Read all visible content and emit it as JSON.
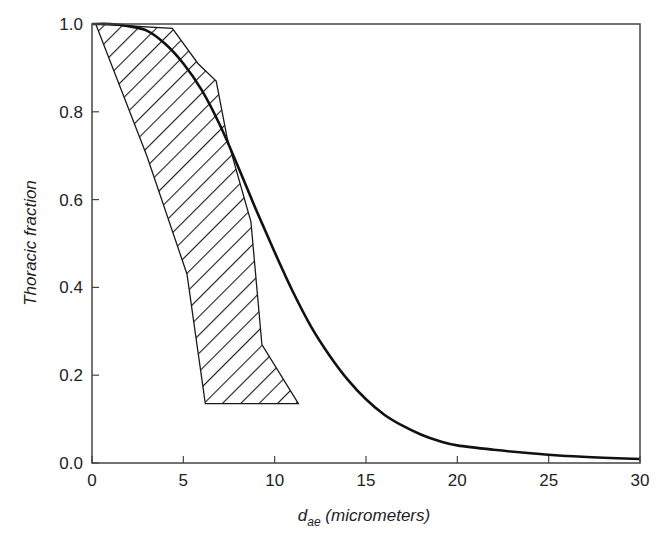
{
  "chart_data": {
    "type": "line",
    "title": "",
    "xlabel": "d_ae (micrometers)",
    "xlabel_main": "d",
    "xlabel_sub": "ae",
    "xlabel_unit": " (micrometers)",
    "ylabel": "Thoracic fraction",
    "xlim": [
      0,
      30
    ],
    "ylim": [
      0,
      1.0
    ],
    "x_ticks": [
      0,
      5,
      10,
      15,
      20,
      25,
      30
    ],
    "x_tick_labels": [
      "0",
      "5",
      "10",
      "15",
      "20",
      "25",
      "30"
    ],
    "y_ticks": [
      0.0,
      0.2,
      0.4,
      0.6,
      0.8,
      1.0
    ],
    "y_tick_labels": [
      "0.0",
      "0.2",
      "0.4",
      "0.6",
      "0.8",
      "1.0"
    ],
    "grid": false,
    "legend": null,
    "series": [
      {
        "name": "Thoracic convention curve",
        "style": "solid",
        "x": [
          0,
          1,
          2,
          3,
          4,
          5,
          6,
          7,
          8,
          9,
          10,
          11,
          12,
          13,
          14,
          15,
          16,
          17,
          18,
          19,
          20,
          22,
          24,
          26,
          28,
          30
        ],
        "values": [
          1.0,
          1.0,
          0.995,
          0.985,
          0.955,
          0.91,
          0.85,
          0.77,
          0.675,
          0.575,
          0.48,
          0.39,
          0.31,
          0.245,
          0.19,
          0.145,
          0.11,
          0.085,
          0.065,
          0.05,
          0.04,
          0.03,
          0.022,
          0.016,
          0.012,
          0.009
        ]
      }
    ],
    "shaded_region": {
      "name": "Hatched band",
      "pattern": "diagonal-hatch",
      "polygon": [
        [
          0.2,
          1.0
        ],
        [
          4.4,
          0.99
        ],
        [
          5.8,
          0.91
        ],
        [
          6.8,
          0.87
        ],
        [
          7.4,
          0.74
        ],
        [
          8.7,
          0.55
        ],
        [
          9.3,
          0.27
        ],
        [
          11.3,
          0.135
        ],
        [
          6.2,
          0.135
        ],
        [
          5.2,
          0.43
        ],
        [
          3.0,
          0.7
        ],
        [
          0.2,
          1.0
        ]
      ]
    }
  }
}
